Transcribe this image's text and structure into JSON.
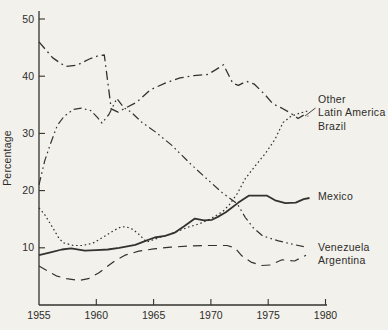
{
  "figure": {
    "background": "#f2f1ec",
    "ink": "#34322e"
  },
  "chart_data": {
    "type": "line",
    "title": "",
    "xlabel": "",
    "ylabel": "Percentage",
    "xlim": [
      1955,
      1980
    ],
    "ylim": [
      0,
      50
    ],
    "x_ticks": [
      1955,
      1960,
      1965,
      1970,
      1975,
      1980
    ],
    "y_ticks": [
      10,
      20,
      30,
      40,
      50
    ],
    "grid": false,
    "legend": "inline-labels-right",
    "axis_px": {
      "x0": 39,
      "x1": 325.5,
      "y0": 305,
      "y1": 19,
      "xmin": 1955,
      "xmax": 1980,
      "ymin": 0,
      "ymax": 50
    },
    "series": [
      {
        "name": "Other Latin America",
        "slug": "other-latin-america",
        "style": "dashdot",
        "width": 1.3,
        "label_lines": [
          "Other",
          "Latin America"
        ],
        "label_x": 318,
        "label_y": 103,
        "label_line_h": 12.5,
        "leader": [
          315.5,
          108,
          305,
          116
        ],
        "points": [
          [
            1955,
            46
          ],
          [
            1956.2,
            43.2
          ],
          [
            1957.3,
            41.7
          ],
          [
            1958.3,
            41.9
          ],
          [
            1959.4,
            43
          ],
          [
            1960.2,
            43.6
          ],
          [
            1960.7,
            43.7
          ],
          [
            1961.3,
            34.3
          ],
          [
            1961.9,
            33.7
          ],
          [
            1962.5,
            34.4
          ],
          [
            1963.5,
            35.4
          ],
          [
            1964.7,
            37.6
          ],
          [
            1966,
            38.8
          ],
          [
            1967.3,
            39.7
          ],
          [
            1968.5,
            40.1
          ],
          [
            1969.7,
            40.3
          ],
          [
            1970.4,
            41.1
          ],
          [
            1971.1,
            42
          ],
          [
            1971.9,
            38.8
          ],
          [
            1972.4,
            38.4
          ],
          [
            1973.1,
            39.1
          ],
          [
            1973.8,
            38.6
          ],
          [
            1974.7,
            36.8
          ],
          [
            1975.4,
            35.2
          ],
          [
            1976.2,
            34.4
          ],
          [
            1977,
            33.5
          ],
          [
            1977.6,
            32.6
          ],
          [
            1978.1,
            33.2
          ],
          [
            1978.5,
            33
          ]
        ]
      },
      {
        "name": "Brazil",
        "slug": "brazil",
        "style": "dot",
        "width": 1.2,
        "label_lines": [
          "Brazil"
        ],
        "label_x": 318,
        "label_y": 130,
        "label_line_h": 12.5,
        "points": [
          [
            1955,
            17
          ],
          [
            1955.5,
            15.8
          ],
          [
            1956.2,
            13.5
          ],
          [
            1956.7,
            11.8
          ],
          [
            1957.1,
            10.9
          ],
          [
            1958,
            10.4
          ],
          [
            1958.8,
            10.4
          ],
          [
            1959.7,
            10.8
          ],
          [
            1960.8,
            12.1
          ],
          [
            1961.6,
            13.1
          ],
          [
            1962.2,
            13.7
          ],
          [
            1962.7,
            13.6
          ],
          [
            1963.2,
            13.2
          ],
          [
            1963.7,
            12.4
          ],
          [
            1964.4,
            11
          ],
          [
            1965.1,
            11.5
          ],
          [
            1966,
            12.1
          ],
          [
            1967,
            12.8
          ],
          [
            1968,
            13.6
          ],
          [
            1969,
            14.2
          ],
          [
            1970,
            15.1
          ],
          [
            1971,
            16.3
          ],
          [
            1971.6,
            17.5
          ],
          [
            1972.3,
            19.5
          ],
          [
            1973,
            22.1
          ],
          [
            1973.9,
            24.4
          ],
          [
            1974.8,
            26.6
          ],
          [
            1975.6,
            29
          ],
          [
            1976.3,
            31.9
          ],
          [
            1977,
            33
          ],
          [
            1977.7,
            33.5
          ],
          [
            1978.4,
            33.9
          ]
        ]
      },
      {
        "name": "Mexico",
        "slug": "mexico",
        "style": "solid",
        "width": 1.8,
        "label_lines": [
          "Mexico"
        ],
        "label_x": 318,
        "label_y": 200,
        "label_line_h": 12.5,
        "points": [
          [
            1955,
            8.7
          ],
          [
            1956,
            9.2
          ],
          [
            1957,
            9.7
          ],
          [
            1957.8,
            9.9
          ],
          [
            1959,
            9.5
          ],
          [
            1960,
            9.6
          ],
          [
            1961,
            9.7
          ],
          [
            1962,
            10
          ],
          [
            1963.4,
            10.5
          ],
          [
            1964.3,
            11.2
          ],
          [
            1965.1,
            11.8
          ],
          [
            1966,
            12.1
          ],
          [
            1966.8,
            12.6
          ],
          [
            1967.7,
            13.8
          ],
          [
            1968.6,
            15.1
          ],
          [
            1969.4,
            14.8
          ],
          [
            1970.1,
            14.9
          ],
          [
            1970.6,
            15.4
          ],
          [
            1971.3,
            16.2
          ],
          [
            1972.4,
            17.9
          ],
          [
            1973.3,
            19.1
          ],
          [
            1974.9,
            19.1
          ],
          [
            1975.6,
            18.3
          ],
          [
            1976.5,
            17.8
          ],
          [
            1977.4,
            17.9
          ],
          [
            1978.1,
            18.5
          ],
          [
            1978.6,
            18.7
          ]
        ]
      },
      {
        "name": "Venezuela",
        "slug": "venezuela",
        "style": "dashdotdot",
        "width": 1.2,
        "label_lines": [
          "Venezuela"
        ],
        "label_x": 318,
        "label_y": 251,
        "label_line_h": 12.5,
        "points": [
          [
            1955,
            21
          ],
          [
            1955.5,
            25.2
          ],
          [
            1956,
            28.2
          ],
          [
            1956.6,
            31.4
          ],
          [
            1957.2,
            33
          ],
          [
            1958,
            34.2
          ],
          [
            1958.7,
            34.4
          ],
          [
            1959.5,
            34
          ],
          [
            1960.1,
            32.8
          ],
          [
            1960.5,
            31.8
          ],
          [
            1961.1,
            33.3
          ],
          [
            1961.8,
            36.1
          ],
          [
            1962.4,
            34.5
          ],
          [
            1963,
            33.8
          ],
          [
            1964,
            31.9
          ],
          [
            1965.2,
            30.2
          ],
          [
            1966.6,
            27.9
          ],
          [
            1968.2,
            24.7
          ],
          [
            1969.5,
            22.3
          ],
          [
            1971,
            19.6
          ],
          [
            1972.3,
            17.7
          ],
          [
            1973,
            15.3
          ],
          [
            1973.7,
            13.5
          ],
          [
            1974.5,
            12.1
          ],
          [
            1975.9,
            11.2
          ],
          [
            1977.2,
            10.6
          ],
          [
            1978.3,
            10.1
          ]
        ]
      },
      {
        "name": "Argentina",
        "slug": "argentina",
        "style": "dash",
        "width": 1.2,
        "label_lines": [
          "Argentina"
        ],
        "label_x": 318,
        "label_y": 264,
        "label_line_h": 12.5,
        "points": [
          [
            1955,
            6.8
          ],
          [
            1955.7,
            6
          ],
          [
            1956.5,
            5.1
          ],
          [
            1957.4,
            4.6
          ],
          [
            1958.5,
            4.3
          ],
          [
            1959.3,
            4.6
          ],
          [
            1960.2,
            5.6
          ],
          [
            1961.6,
            7.7
          ],
          [
            1962.5,
            8.7
          ],
          [
            1963.7,
            9.4
          ],
          [
            1965,
            9.8
          ],
          [
            1966.5,
            10.1
          ],
          [
            1968,
            10.3
          ],
          [
            1969.5,
            10.4
          ],
          [
            1971.4,
            10.4
          ],
          [
            1972.1,
            10
          ],
          [
            1972.7,
            8.6
          ],
          [
            1973.5,
            7.5
          ],
          [
            1974.4,
            6.9
          ],
          [
            1975.2,
            7
          ],
          [
            1976.2,
            7.9
          ],
          [
            1977.3,
            7.7
          ],
          [
            1978.3,
            8.7
          ]
        ]
      }
    ]
  }
}
